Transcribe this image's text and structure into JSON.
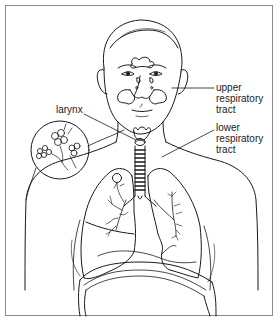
{
  "diagram": {
    "labels": {
      "larynx": "larynx",
      "upper_respiratory_tract": [
        "upper",
        "respiratory",
        "tract"
      ],
      "lower_respiratory_tract": [
        "lower",
        "respiratory",
        "tract"
      ]
    },
    "colors": {
      "line": "#1a1a1a",
      "frame": "#8a8a8a",
      "background": "#ffffff"
    }
  }
}
